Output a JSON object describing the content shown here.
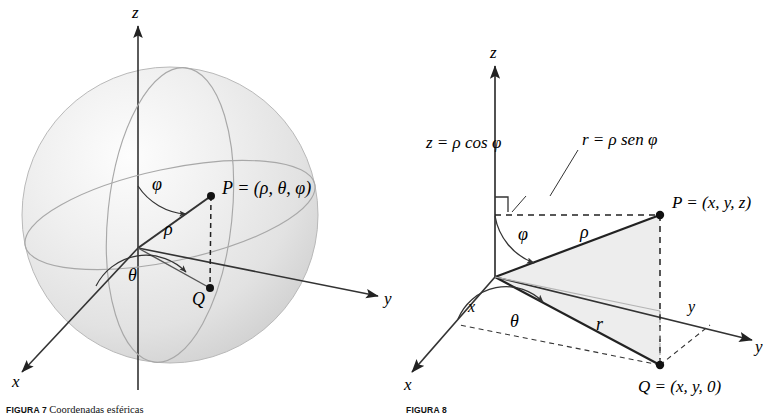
{
  "page": {
    "background": "#ffffff",
    "width": 771,
    "height": 418,
    "ink": "#222222",
    "sphere_fill": "#e9e9e9",
    "triangle_fill": "#ededed"
  },
  "figure_left": {
    "name": "spherical-coordinates-sphere",
    "axes": {
      "z": "z",
      "y": "y",
      "x": "x"
    },
    "labels": {
      "point_p": "P = (ρ, θ, φ)",
      "point_q": "Q",
      "rho": "ρ",
      "phi": "φ",
      "theta": "θ"
    },
    "caption_tag": "FIGURA 7",
    "caption_text": "Coordenadas esféricas"
  },
  "figure_right": {
    "name": "spherical-to-cartesian-triangle",
    "axes": {
      "z": "z",
      "y": "y",
      "x": "x",
      "y_mid": "y",
      "x_mid": "x"
    },
    "labels": {
      "point_p": "P = (x, y, z)",
      "point_q": "Q = (x, y, 0)",
      "rho": "ρ",
      "r": "r",
      "phi": "φ",
      "theta": "θ",
      "z_expr": "z = ρ cos φ",
      "r_expr": "r = ρ sen φ"
    },
    "caption_tag": "FIGURA 8",
    "caption_text": ""
  }
}
